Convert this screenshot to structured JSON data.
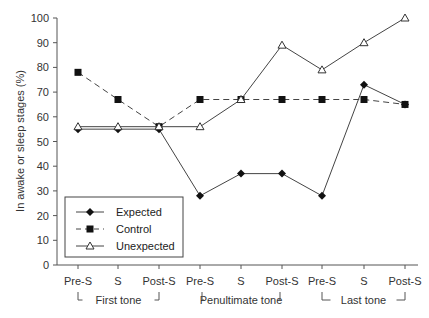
{
  "chart_data": {
    "type": "line",
    "title": "",
    "xlabel": "",
    "ylabel": "In awake or sleep stages (%)",
    "ylim": [
      0,
      100
    ],
    "yticks": [
      0,
      10,
      20,
      30,
      40,
      50,
      60,
      70,
      80,
      90,
      100
    ],
    "grid": false,
    "legend_position": "lower-left inside",
    "categories": [
      "Pre-S",
      "S",
      "Post-S",
      "Pre-S",
      "S",
      "Post-S",
      "Pre-S",
      "S",
      "Post-S"
    ],
    "groups": [
      {
        "label": "First tone",
        "start": 0,
        "end": 2
      },
      {
        "label": "Penultimate tone",
        "start": 3,
        "end": 5
      },
      {
        "label": "Last tone",
        "start": 6,
        "end": 8
      }
    ],
    "series": [
      {
        "name": "Expected",
        "marker": "diamond-filled",
        "line": "solid",
        "values": [
          55,
          55,
          55,
          28,
          37,
          37,
          28,
          73,
          65
        ]
      },
      {
        "name": "Control",
        "marker": "square-filled",
        "line": "dashed",
        "values": [
          78,
          67,
          56,
          67,
          67,
          67,
          67,
          67,
          65
        ]
      },
      {
        "name": "Unexpected",
        "marker": "triangle-open",
        "line": "solid",
        "values": [
          56,
          56,
          56,
          56,
          67,
          89,
          79,
          90,
          100
        ]
      }
    ]
  },
  "legend": {
    "items": [
      {
        "label": "Expected"
      },
      {
        "label": "Control"
      },
      {
        "label": "Unexpected"
      }
    ]
  }
}
